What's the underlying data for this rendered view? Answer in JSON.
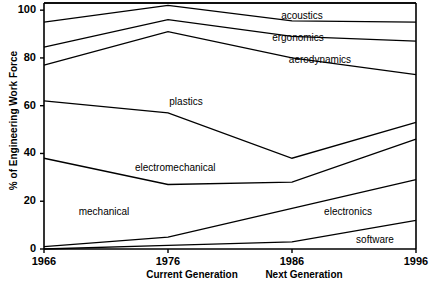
{
  "chart_data": {
    "type": "area",
    "title": "",
    "subtitle": "",
    "xlabel": "",
    "ylabel": "% of Engineering Work Force",
    "x": [
      1966,
      1976,
      1986,
      1996
    ],
    "xtick_labels": [
      "1966",
      "1976",
      "1986",
      "1996"
    ],
    "ytick_labels": [
      "0",
      "20",
      "40",
      "60",
      "80",
      "100"
    ],
    "yticks": [
      0,
      20,
      40,
      60,
      80,
      100
    ],
    "ylim": [
      0,
      103
    ],
    "xlim": [
      1966,
      1996
    ],
    "stacked": true,
    "grid": false,
    "legend": "inline-area-labels",
    "series": [
      {
        "name": "software",
        "label": "software",
        "values": [
          0.0,
          1.5,
          3.0,
          12.0
        ],
        "cumulative": [
          0.0,
          1.5,
          3.0,
          12.0
        ]
      },
      {
        "name": "electronics",
        "label": "electronics",
        "values": [
          1.0,
          3.5,
          14.0,
          17.0
        ],
        "cumulative": [
          1.0,
          5.0,
          17.0,
          29.0
        ]
      },
      {
        "name": "mechanical",
        "label": "mechanical",
        "values": [
          37.0,
          22.0,
          11.0,
          17.0
        ],
        "cumulative": [
          38.0,
          27.0,
          28.0,
          46.0
        ]
      },
      {
        "name": "electromechanical",
        "label": "electromechanical",
        "values": [
          24.0,
          30.0,
          10.0,
          7.0
        ],
        "cumulative": [
          62.0,
          57.0,
          38.0,
          53.0
        ]
      },
      {
        "name": "plastics",
        "label": "plastics",
        "values": [
          15.0,
          34.0,
          42.0,
          20.0
        ],
        "cumulative": [
          77.0,
          91.0,
          80.0,
          73.0
        ]
      },
      {
        "name": "aerodynamics",
        "label": "aerodynamics",
        "values": [
          7.5,
          5.0,
          9.0,
          14.0
        ],
        "cumulative": [
          84.5,
          96.0,
          89.0,
          87.0
        ]
      },
      {
        "name": "ergonomics",
        "label": "ergonomics",
        "values": [
          10.5,
          6.0,
          6.5,
          8.0
        ],
        "cumulative": [
          95.0,
          102.0,
          95.5,
          95.0
        ]
      },
      {
        "name": "acoustics",
        "label": "acoustics",
        "values": [
          8.0,
          1.0,
          7.5,
          8.0
        ],
        "cumulative": [
          103.0,
          103.0,
          103.0,
          103.0
        ]
      }
    ],
    "annotations": [
      {
        "text": "acoustics",
        "x_px": 302,
        "y_px": 16
      },
      {
        "text": "ergonomics",
        "x_px": 298,
        "y_px": 38
      },
      {
        "text": "aerodynamics",
        "x_px": 320,
        "y_px": 60
      },
      {
        "text": "plastics",
        "x_px": 186,
        "y_px": 102
      },
      {
        "text": "electromechanical",
        "x_px": 175,
        "y_px": 168
      },
      {
        "text": "mechanical",
        "x_px": 104,
        "y_px": 212
      },
      {
        "text": "electronics",
        "x_px": 348,
        "y_px": 212
      },
      {
        "text": "software",
        "x_px": 375,
        "y_px": 240
      }
    ],
    "generation_labels": [
      {
        "text": "Current Generation",
        "x_px": 192
      },
      {
        "text": "Next Generation",
        "x_px": 304
      }
    ]
  },
  "colors": {
    "line": "#000000",
    "axis": "#000000",
    "background": "#ffffff",
    "text": "#000000"
  }
}
